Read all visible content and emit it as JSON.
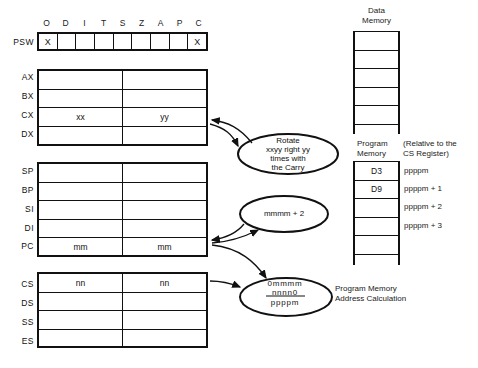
{
  "psw": {
    "label": "PSW",
    "flags": [
      "O",
      "D",
      "I",
      "T",
      "S",
      "Z",
      "A",
      "P",
      "C"
    ],
    "values": [
      "X",
      "",
      "",
      "",
      "",
      "",
      "",
      "",
      "X"
    ]
  },
  "general_registers": [
    {
      "name": "AX",
      "high": "",
      "low": ""
    },
    {
      "name": "BX",
      "high": "",
      "low": ""
    },
    {
      "name": "CX",
      "high": "xx",
      "low": "yy"
    },
    {
      "name": "DX",
      "high": "",
      "low": ""
    }
  ],
  "pointer_registers": [
    {
      "name": "SP",
      "high": "",
      "low": ""
    },
    {
      "name": "BP",
      "high": "",
      "low": ""
    },
    {
      "name": "SI",
      "high": "",
      "low": ""
    },
    {
      "name": "DI",
      "high": "",
      "low": ""
    },
    {
      "name": "PC",
      "high": "mm",
      "low": "mm"
    }
  ],
  "segment_registers": [
    {
      "name": "CS",
      "high": "nn",
      "low": "nn"
    },
    {
      "name": "DS",
      "high": "",
      "low": ""
    },
    {
      "name": "SS",
      "high": "",
      "low": ""
    },
    {
      "name": "ES",
      "high": "",
      "low": ""
    }
  ],
  "data_memory": {
    "title_line1": "Data",
    "title_line2": "Memory",
    "rows": 6
  },
  "program_memory": {
    "title_line1": "Program",
    "title_line2": "Memory",
    "note_line1": "(Relative to the",
    "note_line2": "CS Register)",
    "cells": [
      "D3",
      "D9",
      "",
      "",
      "",
      ""
    ],
    "addresses": [
      "ppppm",
      "ppppm + 1",
      "ppppm + 2",
      "ppppm + 3"
    ]
  },
  "ellipses": {
    "rotate": [
      "Rotate",
      "xxyy right yy",
      "times with",
      "the Carry"
    ],
    "increment": "mmmm + 2",
    "address_calc": {
      "line1": "0mmmm",
      "line2": "nnnn0",
      "result": "ppppm"
    }
  },
  "address_calc_label": {
    "line1": "Program Memory",
    "line2": "Address Calculation"
  }
}
